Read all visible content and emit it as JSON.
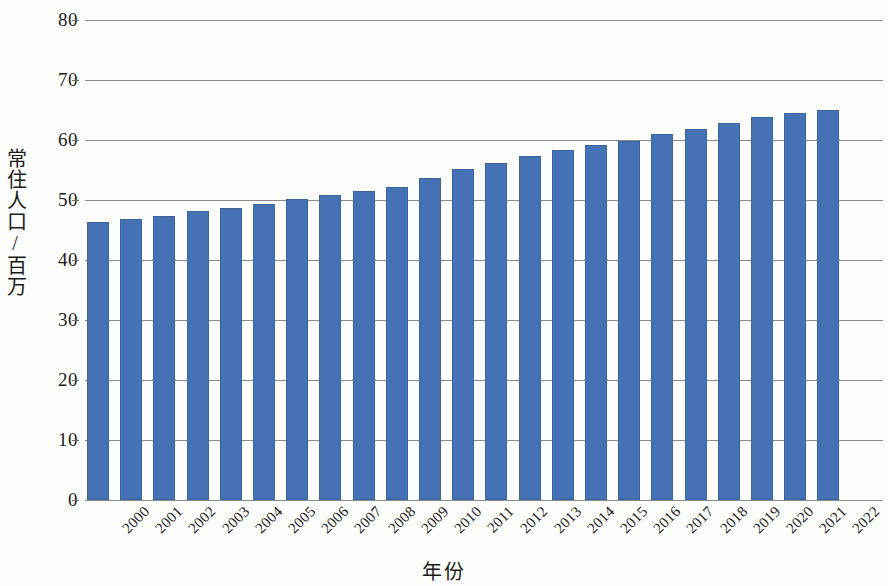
{
  "chart_data": {
    "type": "bar",
    "title": "",
    "xlabel": "年份",
    "ylabel": "常住人口/百万",
    "categories": [
      "2000",
      "2001",
      "2002",
      "2003",
      "2004",
      "2005",
      "2006",
      "2007",
      "2008",
      "2009",
      "2010",
      "2011",
      "2012",
      "2013",
      "2014",
      "2015",
      "2016",
      "2017",
      "2018",
      "2019",
      "2020",
      "2021",
      "2022"
    ],
    "values": [
      46.4,
      46.8,
      47.4,
      48.1,
      48.7,
      49.4,
      50.1,
      50.8,
      51.5,
      52.2,
      53.7,
      55.2,
      56.1,
      57.3,
      58.4,
      59.1,
      59.9,
      61.0,
      61.9,
      62.8,
      63.9,
      64.5,
      65.0
    ],
    "series": [
      {
        "name": "常住人口",
        "values": [
          46.4,
          46.8,
          47.4,
          48.1,
          48.7,
          49.4,
          50.1,
          50.8,
          51.5,
          52.2,
          53.7,
          55.2,
          56.1,
          57.3,
          58.4,
          59.1,
          59.9,
          61.0,
          61.9,
          62.8,
          63.9,
          64.5,
          65.0
        ]
      }
    ],
    "ylim": [
      0,
      80
    ],
    "yticks": [
      0,
      10,
      20,
      30,
      40,
      50,
      60,
      70,
      80
    ],
    "ytick_labels": [
      "0",
      "10",
      "20",
      "30",
      "40",
      "50",
      "60",
      "70",
      "80"
    ],
    "grid": "horizontal",
    "legend": "none",
    "bar_color": "#4472b4",
    "gridline_color": "#8a8a8a",
    "axis_text_color": "#1b1b1b"
  }
}
